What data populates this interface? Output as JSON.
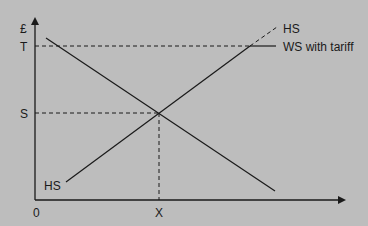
{
  "diagram": {
    "background": "#bdbdbd",
    "line_color": "#1a1a1a",
    "y_axis_label": "£",
    "origin_label": "0",
    "y_ticks": [
      {
        "label": "T",
        "y": 46
      },
      {
        "label": "S",
        "y": 113
      }
    ],
    "x_ticks": [
      {
        "label": "X",
        "x": 159
      }
    ],
    "curves": {
      "home_supply_label_bottom": "HS",
      "home_supply_label_top": "HS",
      "world_supply_tariff_label": "WS with tariff"
    }
  }
}
